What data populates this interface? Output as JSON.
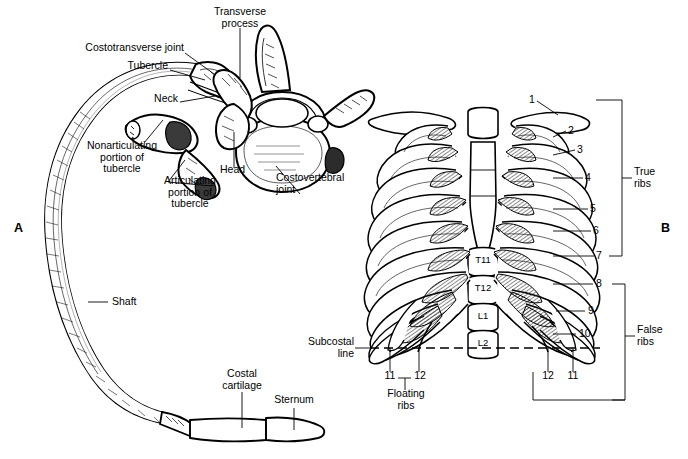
{
  "figure": {
    "caption_label": "FIGURE 6–4",
    "panel_a_letter": "A",
    "panel_b_letter": "B"
  },
  "panel_a": {
    "title_letter": "A",
    "labels": [
      {
        "id": "transverse-process",
        "text": "Transverse\nprocess"
      },
      {
        "id": "costotransverse-joint",
        "text": "Costotransverse joint"
      },
      {
        "id": "tubercle",
        "text": "Tubercle"
      },
      {
        "id": "neck",
        "text": "Neck"
      },
      {
        "id": "nonarticulating-portion-of-tubercle",
        "text": "Nonarticulating\nportion of\ntubercle"
      },
      {
        "id": "articulating-portion-of-tubercle",
        "text": "Articulating\nportion of\ntubercle"
      },
      {
        "id": "head",
        "text": "Head"
      },
      {
        "id": "costovertebral-joint",
        "text": "Costovertebral\njoint"
      },
      {
        "id": "shaft",
        "text": "Shaft"
      },
      {
        "id": "costal-cartilage",
        "text": "Costal\ncartilage"
      },
      {
        "id": "sternum",
        "text": "Sternum"
      }
    ]
  },
  "panel_b": {
    "title_letter": "B",
    "rib_numbers_right": [
      "1",
      "2",
      "3",
      "4",
      "5",
      "6",
      "7",
      "8",
      "9",
      "10"
    ],
    "floating_left": [
      "11",
      "12"
    ],
    "floating_right": [
      "12",
      "11"
    ],
    "vertebrae": [
      "T11",
      "T12",
      "L1",
      "L2"
    ],
    "brackets": [
      {
        "id": "true-ribs",
        "text": "True\nribs"
      },
      {
        "id": "false-ribs",
        "text": "False\nribs"
      }
    ],
    "labels": [
      {
        "id": "subcostal-line",
        "text": "Subcostal\nline"
      },
      {
        "id": "floating-ribs",
        "text": "Floating\nribs"
      }
    ]
  },
  "colors": {
    "ink": "#000000",
    "paper": "#ffffff",
    "caption_text": "#4d4d4d",
    "rule_dark": "#6f7276",
    "rule_light": "#f4f5f6"
  }
}
